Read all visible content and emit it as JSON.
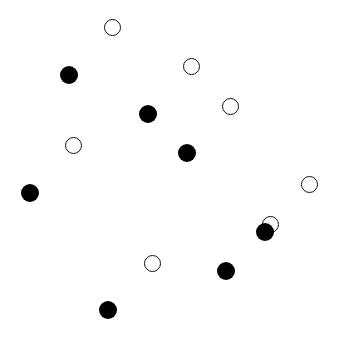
{
  "figure": {
    "grid_size": 7,
    "cell_px": 39.3,
    "back_grid": {
      "origin": [
        53,
        7
      ],
      "style": "thin",
      "marker": "open-circle",
      "markers": [
        {
          "col": 1,
          "row": 0
        },
        {
          "col": 3,
          "row": 1
        },
        {
          "col": 4,
          "row": 2
        },
        {
          "col": 0,
          "row": 3
        },
        {
          "col": 6,
          "row": 4
        },
        {
          "col": 5,
          "row": 5
        },
        {
          "col": 2,
          "row": 6
        }
      ]
    },
    "front_grid": {
      "origin": [
        9,
        54
      ],
      "style": "thick",
      "marker": "filled-circle",
      "markers": [
        {
          "col": 1,
          "row": 0
        },
        {
          "col": 3,
          "row": 1
        },
        {
          "col": 4,
          "row": 2
        },
        {
          "col": 0,
          "row": 3
        },
        {
          "col": 6,
          "row": 4
        },
        {
          "col": 5,
          "row": 5
        },
        {
          "col": 2,
          "row": 6
        }
      ]
    },
    "colors": {
      "line": "#111111",
      "background": "#ffffff"
    }
  }
}
